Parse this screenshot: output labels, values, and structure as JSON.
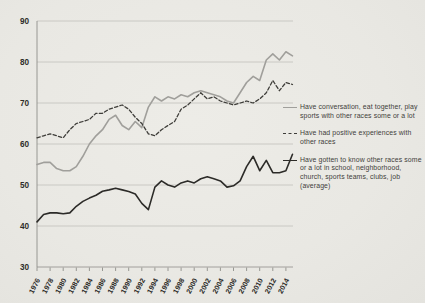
{
  "chart_data": {
    "type": "line",
    "title": "",
    "xlabel": "",
    "ylabel": "",
    "years": [
      1976,
      1977,
      1978,
      1979,
      1980,
      1981,
      1982,
      1983,
      1984,
      1985,
      1986,
      1987,
      1988,
      1989,
      1990,
      1991,
      1992,
      1993,
      1994,
      1995,
      1996,
      1997,
      1998,
      1999,
      2000,
      2001,
      2002,
      2003,
      2004,
      2005,
      2006,
      2007,
      2008,
      2009,
      2010,
      2011,
      2012,
      2013,
      2014,
      2015
    ],
    "x_tick_labels": [
      "1976",
      "1978",
      "1980",
      "1982",
      "1984",
      "1986",
      "1988",
      "1990",
      "1992",
      "1994",
      "1996",
      "1998",
      "2000",
      "2002",
      "2004",
      "2006",
      "2008",
      "2010",
      "2012",
      "2014"
    ],
    "y_ticks": [
      30,
      40,
      50,
      60,
      70,
      80,
      90
    ],
    "ylim": [
      30,
      90
    ],
    "grid": "horizontal",
    "legend_position": "right",
    "series": [
      {
        "name": "conversation-eat-play-sports",
        "label": "Have conversation, eat together, play sports with other races some or a lot",
        "style": "solid",
        "color": "#a09f9b",
        "values": [
          55,
          55.5,
          55.5,
          54,
          53.5,
          53.5,
          54.5,
          57,
          60,
          62,
          63.5,
          66,
          67,
          64.5,
          63.5,
          65.5,
          64,
          69,
          71.5,
          70.5,
          71.5,
          71,
          72,
          71.5,
          72.5,
          73,
          72.5,
          72,
          71.5,
          70.5,
          70,
          72.5,
          75,
          76.5,
          75.5,
          80.5,
          82,
          80.5,
          82.5,
          81.5
        ]
      },
      {
        "name": "positive-experiences",
        "label": "Have had positive experiences with other races",
        "style": "dashed",
        "color": "#3e3d39",
        "values": [
          61.5,
          62,
          62.5,
          62,
          61.5,
          63.5,
          65,
          65.5,
          66,
          67.5,
          67.5,
          68.5,
          69,
          69.5,
          68.5,
          66.5,
          65,
          62.5,
          62,
          63.5,
          64.5,
          65.5,
          68.5,
          69.5,
          71,
          72.5,
          71,
          71.5,
          70.5,
          70,
          69.5,
          70,
          70.5,
          70,
          71,
          72.5,
          75.5,
          73,
          75,
          74.5
        ]
      },
      {
        "name": "gotten-to-know-other-races",
        "label": "Have gotten to know other races some or a lot in school, neighborhood, church, sports teams, clubs, job (average)",
        "style": "solid",
        "color": "#2c2b28",
        "values": [
          41,
          42.8,
          43.2,
          43.2,
          43,
          43.2,
          44.8,
          46,
          46.8,
          47.5,
          48.5,
          48.8,
          49.2,
          48.8,
          48.4,
          47.8,
          45.5,
          44,
          49.5,
          51,
          50,
          49.5,
          50.5,
          51,
          50.5,
          51.5,
          52,
          51.5,
          51,
          49.5,
          49.8,
          51,
          54.5,
          57,
          53.5,
          56,
          53,
          53,
          53.5,
          57.5
        ]
      }
    ]
  },
  "colors": {
    "background": "#e9e8e3",
    "gridline": "#c1c0bb",
    "axis": "#8f8e8a",
    "tick_label": "#2e2d2a",
    "legend_text": "#3f3e3a"
  }
}
